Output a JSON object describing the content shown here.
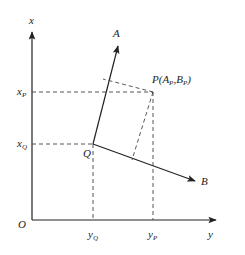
{
  "diagram": {
    "type": "coordinate-projection",
    "axes": {
      "vertical_label": "x",
      "horizontal_label": "y",
      "origin_label": "O"
    },
    "vectors": {
      "a_label": "A",
      "b_label": "B"
    },
    "points": {
      "q_label": "Q",
      "p_label": "P(A",
      "p_sub1": "P",
      "p_mid": ",B",
      "p_sub2": "P",
      "p_close": ")"
    },
    "ticks": {
      "xp_main": "x",
      "xp_sub": "P",
      "xq_main": "x",
      "xq_sub": "Q",
      "yq_main": "y",
      "yq_sub": "Q",
      "yp_main": "y",
      "yp_sub": "P"
    },
    "colors": {
      "line": "#222222",
      "dash": "#444444",
      "background": "#ffffff"
    }
  }
}
